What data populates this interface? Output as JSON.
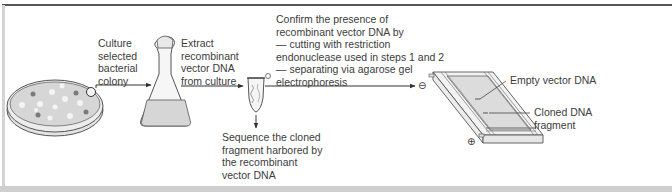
{
  "figure": {
    "caption_partial": "... recombinant vector DNA ..."
  },
  "steps": {
    "culture": {
      "label": "Culture\nselected\nbacterial\ncolony"
    },
    "extract": {
      "label": "Extract\nrecombinant\nvector DNA\nfrom culture"
    },
    "confirm": {
      "label": "Confirm the presence of\nrecombinant vector DNA by\n— cutting with restriction\nendonuclease used in steps 1 and 2\n— separating via agarose gel\nelectrophoresis"
    },
    "sequence": {
      "label": "Sequence the cloned\nfragment harbored by\nthe recombinant\nvector DNA"
    }
  },
  "gel": {
    "band_empty": "Empty vector DNA",
    "band_cloned": "Cloned DNA\nfragment",
    "cathode_symbol": "⊖",
    "anode_symbol": "⊕"
  },
  "icons": {
    "petri_dish": "petri-dish-icon",
    "flask": "erlenmeyer-flask-icon",
    "tube": "microcentrifuge-tube-icon",
    "gel_box": "gel-electrophoresis-icon"
  },
  "colors": {
    "ink": "#3c3c3c",
    "fill_gray": "#d9d9d9",
    "colony_dark": "#7a7a7a",
    "colony_light": "#f4f4f4"
  }
}
